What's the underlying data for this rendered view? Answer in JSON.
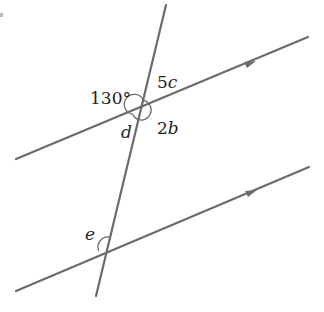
{
  "diagram": {
    "type": "parallel-lines-transversal",
    "colors": {
      "line": "#6b6b6b",
      "text": "#222222"
    },
    "labels": {
      "angle_top_left": "130°",
      "angle_top_right_coef": "5",
      "angle_top_right_var": "c",
      "angle_bottom_left": "d",
      "angle_bottom_right_coef": "2",
      "angle_bottom_right_var": "b",
      "angle_lower_intersection": "e"
    }
  }
}
